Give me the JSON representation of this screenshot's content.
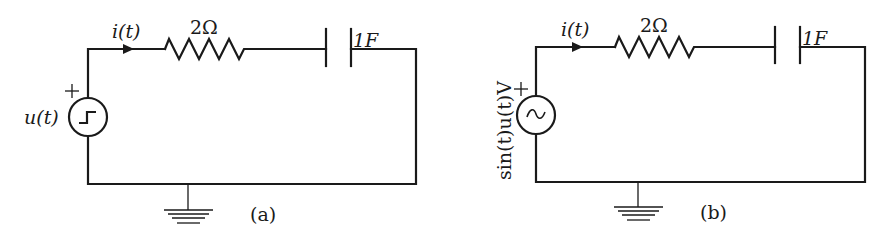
{
  "figure": {
    "panels": [
      {
        "id": "a",
        "caption": "(a)",
        "source": {
          "type": "step",
          "icon": "step-source-icon",
          "label": "u(t)",
          "polarity": "+"
        },
        "current_label": "i(t)",
        "resistor_label": "2Ω",
        "capacitor_label": "1F",
        "ground": "ground-icon"
      },
      {
        "id": "b",
        "caption": "(b)",
        "source": {
          "type": "sinusoidal",
          "icon": "ac-source-icon",
          "label": "sin(t)u(t)V",
          "polarity": "+"
        },
        "current_label": "i(t)",
        "resistor_label": "2Ω",
        "capacitor_label": "1F",
        "ground": "ground-icon"
      }
    ]
  }
}
